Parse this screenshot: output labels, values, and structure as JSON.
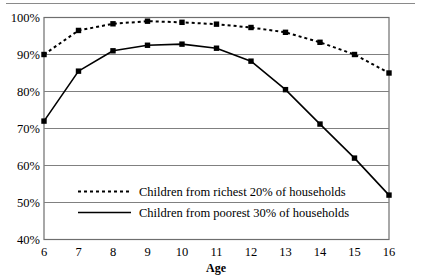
{
  "chart_data": {
    "type": "line",
    "title": "",
    "subtitle": "",
    "xlabel": "Age",
    "ylabel": "",
    "x": [
      6,
      7,
      8,
      9,
      10,
      11,
      12,
      13,
      14,
      15,
      16
    ],
    "categories": [
      "6",
      "7",
      "8",
      "9",
      "10",
      "11",
      "12",
      "13",
      "14",
      "15",
      "16"
    ],
    "xlim": [
      6,
      16
    ],
    "ylim": [
      40,
      100
    ],
    "ytick_labels": [
      "40%",
      "50%",
      "60%",
      "70%",
      "80%",
      "90%",
      "100%"
    ],
    "ytick_values": [
      40,
      50,
      60,
      70,
      80,
      90,
      100
    ],
    "grid": "horizontal",
    "legend_position": "inside-lower-center",
    "series": [
      {
        "name": "Children from richest 20% of households",
        "style": "dotted",
        "marker": "square",
        "color": "#000000",
        "values": [
          90,
          96.5,
          98.3,
          99,
          98.7,
          98.2,
          97.3,
          96,
          93.3,
          90,
          85
        ]
      },
      {
        "name": "Children from poorest 30% of households",
        "style": "solid",
        "marker": "square",
        "color": "#000000",
        "values": [
          72,
          85.5,
          91,
          92.5,
          92.8,
          91.7,
          88.2,
          80.5,
          71.2,
          62,
          52
        ]
      }
    ]
  },
  "legend": {
    "entries": [
      {
        "label": "Children from richest 20% of households",
        "style": "dotted"
      },
      {
        "label": "Children from poorest 30% of households",
        "style": "solid"
      }
    ]
  },
  "colors": {
    "ink": "#000000",
    "gridline": "#808080",
    "axis_frame": "#6e6e6e",
    "top_rule": "#8a8a8a",
    "background": "#ffffff"
  }
}
